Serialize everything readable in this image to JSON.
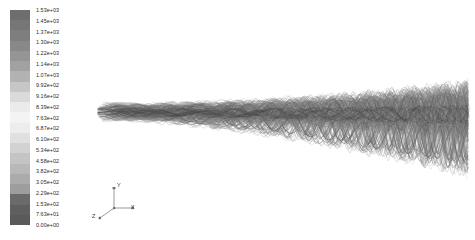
{
  "figure": {
    "background_color": "#ffffff",
    "width": 475,
    "height": 240
  },
  "colorbar": {
    "name": "velocity-magnitude-colorbar",
    "orientation": "vertical",
    "x": 10,
    "y": 10,
    "width": 20,
    "height": 215,
    "band_count": 21,
    "tick_labels": [
      "1.53e+03",
      "1.45e+03",
      "1.37e+03",
      "1.30e+03",
      "1.22e+03",
      "1.14e+03",
      "1.07e+03",
      "9.92e+02",
      "9.16e+02",
      "8.39e+02",
      "7.63e+02",
      "6.87e+02",
      "6.10e+02",
      "5.34e+02",
      "4.58e+02",
      "3.82e+02",
      "3.05e+02",
      "2.29e+02",
      "1.53e+02",
      "7.63e+01",
      "0.00e+00"
    ],
    "band_colors": [
      "#6e6e6e",
      "#767676",
      "#7e7e7e",
      "#888888",
      "#959595",
      "#a2a2a2",
      "#b2b2b2",
      "#c6c6c6",
      "#dadada",
      "#ebebeb",
      "#f3f3f3",
      "#ededed",
      "#e0e0e0",
      "#d2d2d2",
      "#c4c4c4",
      "#b8b8b8",
      "#ababab",
      "#9d9d9d",
      "#6a6a6a",
      "#5f5f5f",
      "#5a5a5a"
    ],
    "label_color": "#2b2b2b",
    "max_value": 1530,
    "min_value": 0
  },
  "axis_triad": {
    "name": "orientation-axes",
    "labels": {
      "x": "X",
      "y": "Y",
      "z": "Z"
    },
    "color": "#3a3a3a"
  },
  "chart_data": {
    "type": "line",
    "title": "",
    "subtitle": "",
    "xlabel": "X",
    "ylabel": "Y",
    "zlabel": "Z",
    "legend": [],
    "grid": false,
    "colormap": "grayscale-rainbow",
    "value_range": [
      0,
      1530
    ],
    "value_unit": "",
    "series": [
      {
        "name": "streamline-bundle",
        "count": 120,
        "x_extent": [
          20,
          390
        ],
        "core_y": 108,
        "bundle_half_width_left": 7,
        "bundle_half_width_right": 26
      }
    ],
    "annotations": []
  }
}
